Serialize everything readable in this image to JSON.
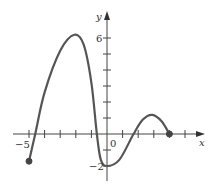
{
  "chart_data": {
    "type": "line",
    "title": "",
    "xlabel": "x",
    "ylabel": "y",
    "xlim": [
      -5.5,
      6.2
    ],
    "ylim": [
      -2.8,
      6.8
    ],
    "grid": false,
    "x_tick_labels": [
      {
        "value": -5,
        "label": "−5"
      },
      {
        "value": 0,
        "label": "0"
      }
    ],
    "y_tick_labels": [
      {
        "value": 6,
        "label": "6"
      },
      {
        "value": -2,
        "label": "−2"
      }
    ],
    "x_ticks": [
      -5,
      -4,
      -3,
      -2,
      -1,
      1,
      2,
      3,
      4,
      5
    ],
    "y_ticks": [
      -2,
      -1,
      1,
      2,
      3,
      4,
      5,
      6
    ],
    "series": [
      {
        "name": "f(x)",
        "x": [
          -5,
          -4.6,
          -4,
          -3,
          -2.1,
          -1.5,
          -1,
          -0.65,
          -0.4,
          0,
          0.8,
          1.7,
          2.3,
          2.9,
          3.5,
          4
        ],
        "values": [
          -1.7,
          0,
          2.6,
          5.2,
          6.2,
          5.6,
          3.2,
          0,
          -1.6,
          -2,
          -1.6,
          0,
          0.9,
          1.2,
          0.8,
          0
        ]
      }
    ],
    "endpoints": [
      {
        "x": -5,
        "y": -1.7,
        "closed": true
      },
      {
        "x": 4,
        "y": 0,
        "closed": true
      }
    ]
  },
  "axes": {
    "x_label": "x",
    "y_label": "y",
    "origin_label": "0",
    "x_min_label": "−5",
    "y_max_label": "6",
    "y_min_label": "−2"
  }
}
